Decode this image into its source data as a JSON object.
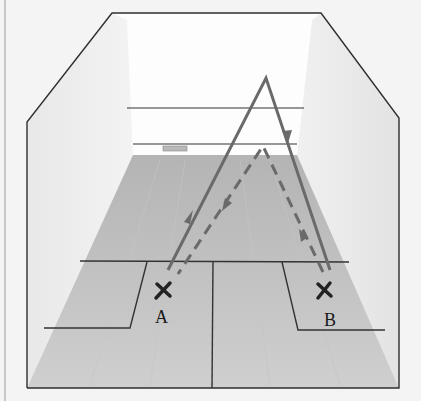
{
  "figure": {
    "players": [
      {
        "id": "A",
        "label": "A",
        "marker": "X"
      },
      {
        "id": "B",
        "label": "B",
        "marker": "X"
      }
    ],
    "paths": [
      {
        "name": "solid-path",
        "style": "solid",
        "from": "A",
        "via": "front-wall-high",
        "to": "B"
      },
      {
        "name": "dashed-path",
        "style": "dashed",
        "from": "B",
        "via": "front-wall-low",
        "to": "A"
      }
    ],
    "colors": {
      "background": "#f4f4f4",
      "wall": "#fbfbfb",
      "side_wall": "#e9e9e9",
      "floor": "#bdbdbd",
      "floor_light": "#d8d8d8",
      "lines": "#333333",
      "path": "#6a6a6a"
    }
  }
}
